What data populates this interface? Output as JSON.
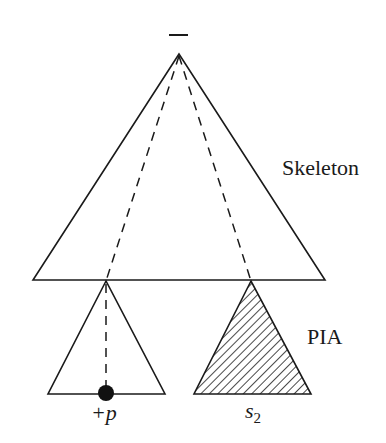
{
  "diagram": {
    "root_label": "−",
    "labels": {
      "skeleton": "Skeleton",
      "pia": "PIA",
      "plus_p": "+p",
      "s2_base": "s",
      "s2_sub": "2"
    },
    "colors": {
      "stroke": "#1a1a1a",
      "background": "#ffffff"
    },
    "shapes": {
      "skeleton_triangle": {
        "apex": [
          179,
          54
        ],
        "base_left": [
          33,
          280
        ],
        "base_right": [
          325,
          280
        ]
      },
      "left_subtree": {
        "apex": [
          106,
          281
        ],
        "base_left": [
          48,
          394
        ],
        "base_right": [
          165,
          394
        ],
        "hatched": false
      },
      "right_subtree": {
        "apex": [
          251,
          281
        ],
        "base_left": [
          194,
          394
        ],
        "base_right": [
          311,
          394
        ],
        "hatched": true
      },
      "dashed_paths": [
        {
          "from": [
            179,
            54
          ],
          "to": [
            106,
            281
          ]
        },
        {
          "from": [
            179,
            54
          ],
          "to": [
            251,
            281
          ]
        },
        {
          "from": [
            106,
            281
          ],
          "to": [
            106,
            392
          ]
        }
      ],
      "marked_node": {
        "center": [
          106,
          392
        ],
        "radius": 8
      }
    }
  }
}
